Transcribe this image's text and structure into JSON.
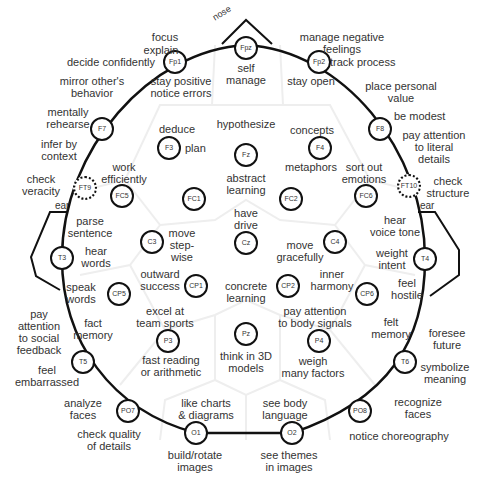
{
  "diagram": {
    "landmarks": {
      "nose": "nose",
      "ear_left": "ear",
      "ear_right": "ear"
    },
    "electrodes": [
      {
        "id": "Fpz",
        "x": 246,
        "y": 48
      },
      {
        "id": "Fp1",
        "x": 175,
        "y": 62
      },
      {
        "id": "Fp2",
        "x": 319,
        "y": 62
      },
      {
        "id": "F7",
        "x": 102,
        "y": 129
      },
      {
        "id": "F3",
        "x": 169,
        "y": 148
      },
      {
        "id": "Fz",
        "x": 246,
        "y": 155
      },
      {
        "id": "F4",
        "x": 320,
        "y": 148
      },
      {
        "id": "F8",
        "x": 380,
        "y": 129
      },
      {
        "id": "FT9",
        "x": 85,
        "y": 188,
        "dotted": true
      },
      {
        "id": "FC5",
        "x": 122,
        "y": 196
      },
      {
        "id": "FC1",
        "x": 194,
        "y": 199
      },
      {
        "id": "FC2",
        "x": 291,
        "y": 199
      },
      {
        "id": "FC6",
        "x": 366,
        "y": 196
      },
      {
        "id": "FT10",
        "x": 409,
        "y": 186,
        "dotted": true
      },
      {
        "id": "T3",
        "x": 62,
        "y": 258
      },
      {
        "id": "C3",
        "x": 152,
        "y": 242
      },
      {
        "id": "Cz",
        "x": 246,
        "y": 243
      },
      {
        "id": "C4",
        "x": 335,
        "y": 242
      },
      {
        "id": "T4",
        "x": 425,
        "y": 259
      },
      {
        "id": "CP5",
        "x": 119,
        "y": 294
      },
      {
        "id": "CP1",
        "x": 196,
        "y": 286
      },
      {
        "id": "CP2",
        "x": 288,
        "y": 286
      },
      {
        "id": "CP6",
        "x": 367,
        "y": 294
      },
      {
        "id": "T5",
        "x": 83,
        "y": 362
      },
      {
        "id": "P3",
        "x": 168,
        "y": 341
      },
      {
        "id": "Pz",
        "x": 246,
        "y": 334
      },
      {
        "id": "P4",
        "x": 319,
        "y": 341
      },
      {
        "id": "T6",
        "x": 405,
        "y": 362
      },
      {
        "id": "PO7",
        "x": 128,
        "y": 411
      },
      {
        "id": "O1",
        "x": 196,
        "y": 433
      },
      {
        "id": "O2",
        "x": 292,
        "y": 433
      },
      {
        "id": "PO8",
        "x": 360,
        "y": 411
      }
    ],
    "labels": [
      {
        "lines": [
          "focus"
        ],
        "x": 165,
        "y": 31,
        "align": "c"
      },
      {
        "lines": [
          "explain"
        ],
        "x": 161,
        "y": 44,
        "align": "c"
      },
      {
        "lines": [
          "decide confidently"
        ],
        "x": 155,
        "y": 56,
        "align": "l"
      },
      {
        "lines": [
          "stay positive",
          "notice errors"
        ],
        "x": 181,
        "y": 75,
        "align": "c"
      },
      {
        "lines": [
          "self",
          "manage"
        ],
        "x": 246,
        "y": 62,
        "align": "c"
      },
      {
        "lines": [
          "manage negative",
          "feelings"
        ],
        "x": 342,
        "y": 31,
        "align": "c"
      },
      {
        "lines": [
          "track process"
        ],
        "x": 330,
        "y": 56,
        "align": "r"
      },
      {
        "lines": [
          "stay open"
        ],
        "x": 311,
        "y": 75,
        "align": "c"
      },
      {
        "lines": [
          "mirror other's",
          "behavior"
        ],
        "x": 92,
        "y": 75,
        "align": "c"
      },
      {
        "lines": [
          "place personal",
          "value"
        ],
        "x": 401,
        "y": 80,
        "align": "c"
      },
      {
        "lines": [
          "mentally",
          "rehearse"
        ],
        "x": 68,
        "y": 106,
        "align": "c"
      },
      {
        "lines": [
          "be modest"
        ],
        "x": 394,
        "y": 110,
        "align": "r"
      },
      {
        "lines": [
          "pay attention",
          "to literal",
          "details"
        ],
        "x": 434,
        "y": 129,
        "align": "c"
      },
      {
        "lines": [
          "infer by",
          "context"
        ],
        "x": 59,
        "y": 138,
        "align": "c"
      },
      {
        "lines": [
          "deduce"
        ],
        "x": 177,
        "y": 123,
        "align": "c"
      },
      {
        "lines": [
          "plan"
        ],
        "x": 185,
        "y": 142,
        "align": "r"
      },
      {
        "lines": [
          "hypothesize"
        ],
        "x": 246,
        "y": 118,
        "align": "c"
      },
      {
        "lines": [
          "concepts"
        ],
        "x": 312,
        "y": 124,
        "align": "c"
      },
      {
        "lines": [
          "metaphors"
        ],
        "x": 311,
        "y": 161,
        "align": "c"
      },
      {
        "lines": [
          "abstract",
          "learning"
        ],
        "x": 246,
        "y": 172,
        "align": "c"
      },
      {
        "lines": [
          "sort out",
          "emotions"
        ],
        "x": 364,
        "y": 161,
        "align": "c"
      },
      {
        "lines": [
          "work",
          "efficiently"
        ],
        "x": 124,
        "y": 161,
        "align": "c"
      },
      {
        "lines": [
          "check",
          "veracity"
        ],
        "x": 41,
        "y": 173,
        "align": "c"
      },
      {
        "lines": [
          "check",
          "structure"
        ],
        "x": 448,
        "y": 175,
        "align": "c"
      },
      {
        "lines": [
          "have",
          "drive"
        ],
        "x": 246,
        "y": 207,
        "align": "c"
      },
      {
        "lines": [
          "parse",
          "sentence"
        ],
        "x": 90,
        "y": 215,
        "align": "c"
      },
      {
        "lines": [
          "hear",
          "voice tone"
        ],
        "x": 395,
        "y": 214,
        "align": "c"
      },
      {
        "lines": [
          "move",
          "step-",
          "wise"
        ],
        "x": 182,
        "y": 227,
        "align": "c"
      },
      {
        "lines": [
          "move",
          "gracefully"
        ],
        "x": 300,
        "y": 239,
        "align": "c"
      },
      {
        "lines": [
          "hear",
          "words"
        ],
        "x": 96,
        "y": 245,
        "align": "c"
      },
      {
        "lines": [
          "weight",
          "intent"
        ],
        "x": 392,
        "y": 247,
        "align": "c"
      },
      {
        "lines": [
          "outward",
          "success"
        ],
        "x": 160,
        "y": 268,
        "align": "c"
      },
      {
        "lines": [
          "inner",
          "harmony"
        ],
        "x": 332,
        "y": 268,
        "align": "c"
      },
      {
        "lines": [
          "concrete",
          "learning"
        ],
        "x": 246,
        "y": 280,
        "align": "c"
      },
      {
        "lines": [
          "speak",
          "words"
        ],
        "x": 81,
        "y": 281,
        "align": "c"
      },
      {
        "lines": [
          "feel",
          "hostile"
        ],
        "x": 407,
        "y": 277,
        "align": "c"
      },
      {
        "lines": [
          "pay attention",
          "to body signals"
        ],
        "x": 315,
        "y": 305,
        "align": "c"
      },
      {
        "lines": [
          "excel at",
          "team sports"
        ],
        "x": 165,
        "y": 305,
        "align": "c"
      },
      {
        "lines": [
          "pay",
          "attention",
          "to social",
          "feedback"
        ],
        "x": 39,
        "y": 308,
        "align": "c"
      },
      {
        "lines": [
          "fact",
          "memory"
        ],
        "x": 93,
        "y": 317,
        "align": "c"
      },
      {
        "lines": [
          "felt",
          "memory"
        ],
        "x": 391,
        "y": 316,
        "align": "c"
      },
      {
        "lines": [
          "foresee",
          "future"
        ],
        "x": 447,
        "y": 327,
        "align": "c"
      },
      {
        "lines": [
          "fast reading",
          "or arithmetic"
        ],
        "x": 171,
        "y": 354,
        "align": "c"
      },
      {
        "lines": [
          "think in 3D",
          "models"
        ],
        "x": 246,
        "y": 350,
        "align": "c"
      },
      {
        "lines": [
          "weigh",
          "many factors"
        ],
        "x": 313,
        "y": 355,
        "align": "c"
      },
      {
        "lines": [
          "symbolize",
          "meaning"
        ],
        "x": 445,
        "y": 361,
        "align": "c"
      },
      {
        "lines": [
          "feel",
          "embarrassed"
        ],
        "x": 47,
        "y": 364,
        "align": "c"
      },
      {
        "lines": [
          "analyze",
          "faces"
        ],
        "x": 83,
        "y": 397,
        "align": "c"
      },
      {
        "lines": [
          "like charts",
          "& diagrams"
        ],
        "x": 206,
        "y": 397,
        "align": "c"
      },
      {
        "lines": [
          "see body",
          "language"
        ],
        "x": 285,
        "y": 397,
        "align": "c"
      },
      {
        "lines": [
          "recognize",
          "faces"
        ],
        "x": 418,
        "y": 396,
        "align": "c"
      },
      {
        "lines": [
          "check quality",
          "of details"
        ],
        "x": 109,
        "y": 428,
        "align": "c"
      },
      {
        "lines": [
          "notice choreography"
        ],
        "x": 399,
        "y": 430,
        "align": "c"
      },
      {
        "lines": [
          "build/rotate",
          "images"
        ],
        "x": 195,
        "y": 449,
        "align": "c"
      },
      {
        "lines": [
          "see themes",
          "in images"
        ],
        "x": 289,
        "y": 449,
        "align": "c"
      }
    ]
  }
}
